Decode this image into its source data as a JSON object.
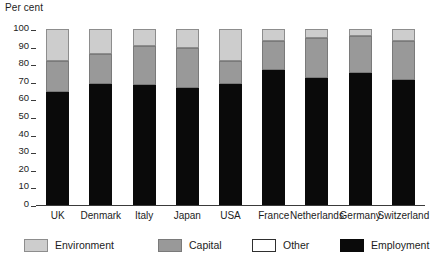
{
  "chart_data": {
    "type": "bar",
    "subtype": "stacked-vertical-100",
    "title": "",
    "ylabel": "Per cent",
    "xlabel": "",
    "ylim": [
      0,
      100
    ],
    "yticks": [
      0,
      10,
      20,
      30,
      40,
      50,
      60,
      70,
      80,
      90,
      100
    ],
    "grid": false,
    "legend_position": "bottom",
    "categories": [
      "UK",
      "Denmark",
      "Italy",
      "Japan",
      "USA",
      "France",
      "Netherlands",
      "Germany",
      "Switzerland"
    ],
    "series": [
      {
        "name": "Employment",
        "color": "#0a0a0a",
        "values": [
          64,
          68.5,
          68,
          66.5,
          69,
          76.5,
          72,
          75,
          71
        ]
      },
      {
        "name": "Capital",
        "color": "#999999",
        "values": [
          18,
          17.5,
          22.5,
          22.5,
          13,
          16.5,
          23,
          21,
          22
        ]
      },
      {
        "name": "Other",
        "color": "#ffffff",
        "values": [
          0,
          0,
          0,
          0,
          0,
          0,
          0,
          0,
          0
        ]
      },
      {
        "name": "Environment",
        "color": "#cdcdcd",
        "values": [
          18,
          14,
          9.5,
          11,
          18,
          7,
          5,
          4,
          7
        ]
      }
    ],
    "cumulative_tops": {
      "employment": [
        64,
        68.5,
        68,
        66.5,
        69,
        76.5,
        72,
        75,
        71
      ],
      "capital": [
        82,
        86,
        90.5,
        89,
        82,
        93,
        95,
        96,
        93
      ],
      "other": [
        82,
        86,
        90.5,
        89,
        82,
        93,
        95,
        96,
        93
      ],
      "environment": [
        100,
        100,
        100,
        100,
        100,
        100,
        100,
        100,
        100
      ]
    }
  },
  "legend": {
    "items": [
      {
        "label": "Environment",
        "swatch": "environment-swatch"
      },
      {
        "label": "Capital",
        "swatch": "capital-swatch"
      },
      {
        "label": "Other",
        "swatch": "other-swatch"
      },
      {
        "label": "Employment",
        "swatch": "employment-swatch"
      }
    ]
  }
}
